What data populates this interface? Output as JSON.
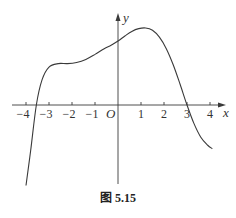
{
  "caption": "图 5.15",
  "chart_data": {
    "type": "line",
    "title": "",
    "xlabel": "x",
    "ylabel": "y",
    "origin_label": "O",
    "xlim": [
      -4.3,
      4.5
    ],
    "ylim": [
      -3.6,
      4.0
    ],
    "grid": false,
    "legend": "none",
    "x_ticks": [
      -4,
      -3,
      -2,
      -1,
      1,
      2,
      3,
      4
    ],
    "x_tick_labels": [
      "−4",
      "−3",
      "−2",
      "−1",
      "1",
      "2",
      "3",
      "4"
    ],
    "series": [
      {
        "name": "f(x)",
        "x": [
          -4.0,
          -3.8,
          -3.55,
          -3.3,
          -3.0,
          -2.6,
          -2.2,
          -1.8,
          -1.4,
          -1.0,
          -0.6,
          -0.3,
          0.0,
          0.3,
          0.6,
          0.9,
          1.2,
          1.5,
          1.8,
          2.1,
          2.4,
          2.7,
          3.0,
          3.3,
          3.6,
          3.9,
          4.1
        ],
        "y": [
          -3.5,
          -2.0,
          0.0,
          1.1,
          1.65,
          1.8,
          1.8,
          1.85,
          1.98,
          2.2,
          2.45,
          2.6,
          2.78,
          3.0,
          3.2,
          3.32,
          3.35,
          3.25,
          2.95,
          2.45,
          1.75,
          0.9,
          0.0,
          -0.8,
          -1.4,
          -1.75,
          -1.9
        ]
      }
    ]
  },
  "colors": {
    "curve": "#3a3a3a",
    "axis": "#3a3a3a"
  }
}
